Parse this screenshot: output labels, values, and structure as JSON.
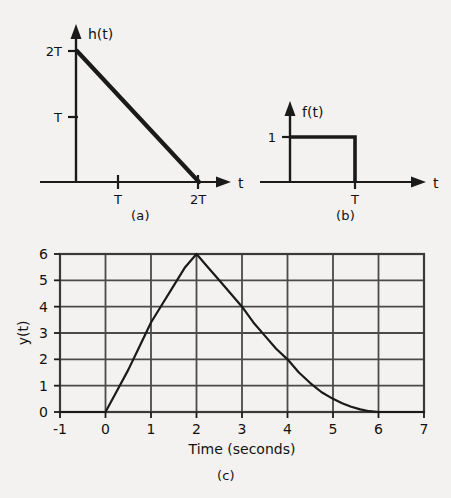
{
  "figure": {
    "background_color": "#f3f2f0",
    "ink_color": "#1a1a1a",
    "captions": {
      "a": "(a)",
      "b": "(b)",
      "c": "(c)"
    }
  },
  "panel_a": {
    "y_axis_label": "h(t)",
    "x_axis_label": "t",
    "y_ticks": [
      "2T",
      "T"
    ],
    "x_ticks": [
      "T",
      "2T"
    ],
    "description": "Descending straight line from (0, 2T) to (2T, 0)"
  },
  "panel_b": {
    "y_axis_label": "f(t)",
    "x_axis_label": "t",
    "y_ticks": [
      "1"
    ],
    "x_ticks": [
      "T"
    ],
    "description": "Rectangular pulse of height 1 from t = 0 to t = T"
  },
  "chart_data": {
    "type": "line",
    "title": "",
    "xlabel": "Time (seconds)",
    "ylabel": "y(t)",
    "xlim": [
      -1,
      7
    ],
    "ylim": [
      0,
      6
    ],
    "xticks": [
      -1,
      0,
      1,
      2,
      3,
      4,
      5,
      6,
      7
    ],
    "xtick_labels": [
      "-1",
      "0",
      "1",
      "2",
      "3",
      "4",
      "5",
      "6",
      "7"
    ],
    "yticks": [
      0,
      1,
      2,
      3,
      4,
      5,
      6
    ],
    "ytick_labels": [
      "0",
      "1",
      "2",
      "3",
      "4",
      "5",
      "6"
    ],
    "grid": true,
    "legend": "none",
    "series": [
      {
        "name": "y(t)",
        "x": [
          -1.0,
          0.0,
          0.25,
          0.5,
          0.75,
          1.0,
          1.25,
          1.5,
          1.75,
          2.0,
          2.25,
          2.5,
          2.75,
          3.0,
          3.25,
          3.5,
          3.75,
          4.0,
          4.25,
          4.5,
          4.75,
          5.0,
          5.2,
          5.4,
          5.6,
          5.8,
          6.0,
          7.0
        ],
        "y": [
          0.0,
          0.0,
          0.8,
          1.6,
          2.5,
          3.4,
          4.1,
          4.8,
          5.5,
          6.0,
          5.5,
          5.0,
          4.5,
          4.0,
          3.4,
          2.9,
          2.4,
          2.0,
          1.5,
          1.1,
          0.75,
          0.5,
          0.33,
          0.2,
          0.1,
          0.03,
          0.0,
          0.0
        ]
      }
    ]
  }
}
